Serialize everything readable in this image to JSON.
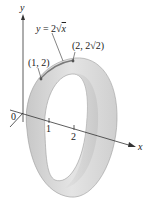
{
  "figure": {
    "type": "surface-of-revolution",
    "curve_label": "y = 2√x",
    "curve_label_parts": {
      "lhs": "y",
      "eq": " = 2",
      "root": "√",
      "arg": "x"
    },
    "point1_label": "(1, 2)",
    "point2_label": "(2, 2√2)",
    "axes": {
      "y_label": "y",
      "x_label": "x",
      "origin_label": "0",
      "x_ticks": [
        "1",
        "2"
      ]
    },
    "colors": {
      "band_fill": "#d6d6d6",
      "band_inner": "#e6e6e6",
      "band_edge": "#9a9a9a",
      "axis": "#333333",
      "text": "#222222"
    }
  }
}
